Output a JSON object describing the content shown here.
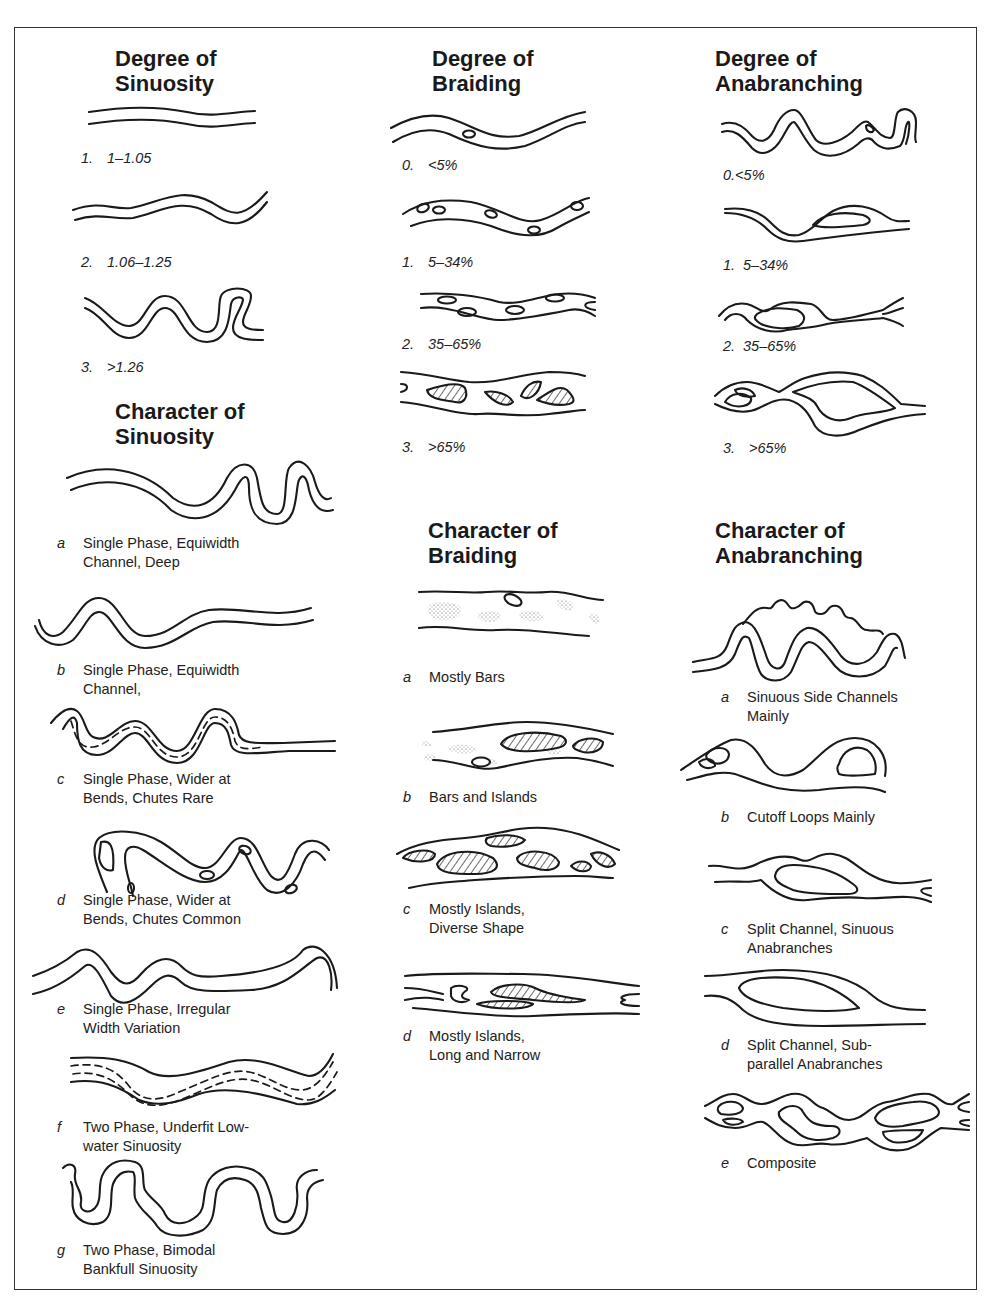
{
  "figure": {
    "columns": [
      {
        "id": "sinuosity",
        "degree": {
          "title": "Degree of\nSinuosity",
          "items": [
            {
              "key": "1.",
              "value": "1–1.05"
            },
            {
              "key": "2.",
              "value": "1.06–1.25"
            },
            {
              "key": "3.",
              "value": ">1.26"
            }
          ]
        },
        "character": {
          "title": "Character of\nSinuosity",
          "items": [
            {
              "key": "a",
              "text": "Single Phase, Equiwidth\nChannel, Deep"
            },
            {
              "key": "b",
              "text": "Single Phase, Equiwidth\nChannel,"
            },
            {
              "key": "c",
              "text": "Single Phase, Wider at\nBends, Chutes Rare"
            },
            {
              "key": "d",
              "text": "Single Phase, Wider at\nBends, Chutes Common"
            },
            {
              "key": "e",
              "text": "Single Phase, Irregular\nWidth Variation"
            },
            {
              "key": "f",
              "text": "Two Phase, Underfit Low-\nwater Sinuosity"
            },
            {
              "key": "g",
              "text": "Two Phase, Bimodal\nBankfull Sinuosity"
            }
          ]
        }
      },
      {
        "id": "braiding",
        "degree": {
          "title": "Degree of\nBraiding",
          "items": [
            {
              "key": "0.",
              "value": "<5%"
            },
            {
              "key": "1.",
              "value": "5–34%"
            },
            {
              "key": "2.",
              "value": "35–65%"
            },
            {
              "key": "3.",
              "value": ">65%"
            }
          ]
        },
        "character": {
          "title": "Character of\nBraiding",
          "items": [
            {
              "key": "a",
              "text": "Mostly Bars"
            },
            {
              "key": "b",
              "text": "Bars and Islands"
            },
            {
              "key": "c",
              "text": "Mostly Islands,\nDiverse Shape"
            },
            {
              "key": "d",
              "text": "Mostly Islands,\nLong and Narrow"
            }
          ]
        }
      },
      {
        "id": "anabranching",
        "degree": {
          "title": "Degree of\nAnabranching",
          "items": [
            {
              "key": "0.",
              "value": "<5%"
            },
            {
              "key": "1.",
              "value": "5–34%"
            },
            {
              "key": "2.",
              "value": "35–65%"
            },
            {
              "key": "3.",
              "value": ">65%"
            }
          ]
        },
        "character": {
          "title": "Character of\nAnabranching",
          "items": [
            {
              "key": "a",
              "text": "Sinuous Side Channels\nMainly"
            },
            {
              "key": "b",
              "text": "Cutoff Loops Mainly"
            },
            {
              "key": "c",
              "text": "Split Channel, Sinuous\nAnabranches"
            },
            {
              "key": "d",
              "text": "Split Channel, Sub-\nparallel Anabranches"
            },
            {
              "key": "e",
              "text": "Composite"
            }
          ]
        }
      }
    ]
  }
}
